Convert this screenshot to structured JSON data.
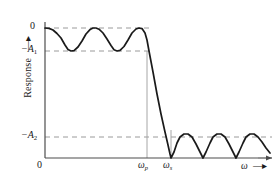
{
  "figure": {
    "kind": "filter-response-plot",
    "axes": {
      "y_axis_label": "Response",
      "y_axis_arrow": "up-arrow",
      "x_axis_label": "ω",
      "x_axis_arrow": "right-arrow",
      "origin_label": "0"
    },
    "y_ticks": [
      {
        "id": "zero",
        "label": "0",
        "label_plain": "0",
        "value_px": 28
      },
      {
        "id": "minus_a1",
        "label": "−A",
        "sub": "1",
        "value_px": 51
      },
      {
        "id": "minus_a2",
        "label": "−A",
        "sub": "2",
        "value_px": 137
      }
    ],
    "x_ticks": [
      {
        "id": "omega_p",
        "label": "ω",
        "sub": "p",
        "value_px": 147
      },
      {
        "id": "omega_s",
        "label": "ω",
        "sub": "s",
        "value_px": 171
      }
    ],
    "colors": {
      "curve": "#1a1a1a",
      "axis": "#4d4d4d",
      "dashed_guide": "#9a9a9a",
      "drop_line": "#9a9a9a",
      "background": "#ffffff"
    },
    "guides": [
      {
        "name": "zero-level-guide",
        "y_px": 28,
        "x_from": 45,
        "x_to": 150,
        "style": "dashed"
      },
      {
        "name": "minus-a1-level-guide",
        "y_px": 51,
        "x_from": 45,
        "x_to": 150,
        "style": "dashed"
      },
      {
        "name": "minus-a2-level-guide",
        "y_px": 137,
        "x_from": 45,
        "x_to": 272,
        "style": "dashed"
      },
      {
        "name": "omega-p-drop-line",
        "x_px": 147,
        "y_from": 51,
        "y_to": 158,
        "style": "solid-thin"
      },
      {
        "name": "omega-s-drop-line",
        "x_px": 171,
        "y_from": 130,
        "y_to": 158,
        "style": "solid-thin"
      }
    ]
  },
  "chart_data": {
    "type": "line",
    "title": "",
    "xlabel": "ω",
    "ylabel": "Response",
    "xlim": [
      0,
      1
    ],
    "ylim": [
      -1,
      0
    ],
    "grid": false,
    "legend": null,
    "annotations": [
      "Equiripple passband oscillating between 0 and -A1 up to omega_p",
      "Monotonic steep transition band from omega_p to omega_s",
      "Equiripple stopband with three lobes peaking at -A2"
    ],
    "levels": {
      "zero": 0,
      "minus_A1": -0.22,
      "minus_A2": -0.84
    },
    "markers": {
      "omega_p": 0.449,
      "omega_s": 0.555
    },
    "series": [
      {
        "name": "magnitude-response",
        "points_px": [
          [
            45,
            28
          ],
          [
            49,
            28.4
          ],
          [
            53,
            30
          ],
          [
            57,
            33.5
          ],
          [
            61,
            38
          ],
          [
            65,
            45
          ],
          [
            68,
            49.5
          ],
          [
            71,
            51
          ],
          [
            74,
            50.6
          ],
          [
            78,
            47
          ],
          [
            82,
            41
          ],
          [
            86,
            34
          ],
          [
            90,
            29.6
          ],
          [
            93,
            28
          ],
          [
            96,
            28
          ],
          [
            99,
            29.2
          ],
          [
            103,
            33
          ],
          [
            107,
            39
          ],
          [
            111,
            45.5
          ],
          [
            114,
            49.8
          ],
          [
            117,
            51
          ],
          [
            120,
            50.4
          ],
          [
            124,
            46.5
          ],
          [
            128,
            40
          ],
          [
            132,
            33
          ],
          [
            136,
            29
          ],
          [
            139,
            28
          ],
          [
            142,
            28.6
          ],
          [
            145,
            33
          ],
          [
            147,
            40
          ],
          [
            149,
            51
          ],
          [
            153,
            72
          ],
          [
            157,
            94
          ],
          [
            161,
            114
          ],
          [
            165,
            132
          ],
          [
            168,
            145
          ],
          [
            170,
            154
          ],
          [
            171,
            158
          ],
          [
            174,
            152
          ],
          [
            177,
            143
          ],
          [
            180,
            137
          ],
          [
            184,
            134
          ],
          [
            188,
            134
          ],
          [
            192,
            137
          ],
          [
            196,
            144
          ],
          [
            200,
            152
          ],
          [
            203,
            158
          ],
          [
            206,
            152
          ],
          [
            210,
            143
          ],
          [
            213,
            137
          ],
          [
            217,
            134
          ],
          [
            221,
            134
          ],
          [
            225,
            137
          ],
          [
            229,
            144
          ],
          [
            233,
            152
          ],
          [
            236,
            158
          ],
          [
            239,
            152
          ],
          [
            243,
            143
          ],
          [
            246,
            137
          ],
          [
            250,
            134
          ],
          [
            254,
            134
          ],
          [
            258,
            137
          ],
          [
            262,
            142
          ],
          [
            266,
            148
          ],
          [
            270,
            153
          ]
        ]
      }
    ]
  },
  "axis_geometry": {
    "x_axis": {
      "x_from": 45,
      "x_to": 272,
      "y_px": 158
    },
    "y_axis": {
      "y_from": 22,
      "y_to": 158,
      "x_px": 45
    }
  }
}
